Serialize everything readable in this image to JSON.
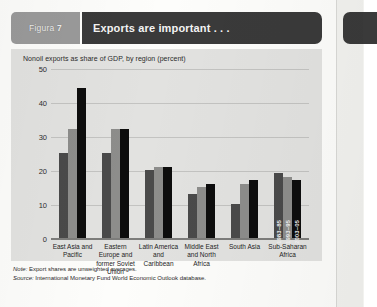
{
  "figure": {
    "tab_prefix": "Figura",
    "tab_number": "7",
    "title": "Exports are important . . .",
    "panel_caption": "Nonoil exports as share of GDP, by region (percent)",
    "note_label": "Note:",
    "note_text": " Export shares are unweighted averages.",
    "source_label": "Source:",
    "source_text": " International Monetary Fund World Economic Outlook database."
  },
  "colors": {
    "series_1": "#4a4a4a",
    "series_2": "#8d8d8b",
    "series_3": "#0d0d0d",
    "panel_bg": "#e2e2e0",
    "header_bar": "#3a3a3a",
    "tab_bg": "#9a9a9a"
  },
  "chart_data": {
    "type": "bar",
    "title": "Exports are important . . .",
    "subtitle": "Nonoil exports as share of GDP, by region (percent)",
    "xlabel": "",
    "ylabel": "",
    "ylim": [
      0,
      50
    ],
    "yticks": [
      0,
      10,
      20,
      30,
      40,
      50
    ],
    "grid": true,
    "legend_position": "on-bars-last-group",
    "categories": [
      "East Asia and Pacific",
      "Eastern Europe and former Soviet Union",
      "Latin America and Caribbean",
      "Middle East and North Africa",
      "South Asia",
      "Sub-Saharan Africa"
    ],
    "series": [
      {
        "name": "1983–85",
        "values": [
          25,
          25,
          20,
          13,
          10,
          19
        ]
      },
      {
        "name": "1993–95",
        "values": [
          32,
          32,
          21,
          15,
          16,
          18
        ]
      },
      {
        "name": "2003–05",
        "values": [
          44,
          32,
          21,
          16,
          17,
          17
        ]
      }
    ]
  }
}
